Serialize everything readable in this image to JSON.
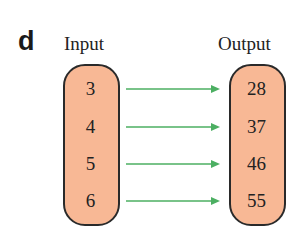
{
  "figure_label": "d",
  "input": {
    "heading": "Input",
    "values": [
      "3",
      "4",
      "5",
      "6"
    ]
  },
  "output": {
    "heading": "Output",
    "values": [
      "28",
      "37",
      "46",
      "55"
    ]
  },
  "colors": {
    "pill_fill": "#f8b895",
    "pill_border": "#2a2a2a",
    "arrow": "#4caf62"
  }
}
